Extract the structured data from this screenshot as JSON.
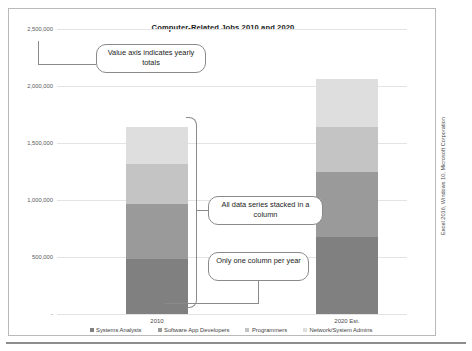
{
  "figure": {
    "credit": "Excel 2016, Windows 10, Microsoft Corporation"
  },
  "callouts": [
    {
      "id": "value-axis",
      "text": "Value axis indicates yearly totals"
    },
    {
      "id": "stacked-series",
      "text": "All data series stacked in a column"
    },
    {
      "id": "one-column",
      "text": "Only one column per year"
    }
  ],
  "chart_data": {
    "type": "bar",
    "subtype": "stacked-column",
    "title": "Computer-Related Jobs 2010 and 2020",
    "xlabel": "",
    "ylabel": "",
    "categories": [
      "2010",
      "2020 Est."
    ],
    "ylim": [
      0,
      2500000
    ],
    "yticks": [
      0,
      500000,
      1000000,
      1500000,
      2000000,
      2500000
    ],
    "ytick_labels": [
      "-",
      "500,000",
      "1,000,000",
      "1,500,000",
      "2,000,000",
      "2,500,000"
    ],
    "grid": true,
    "legend_position": "bottom",
    "series": [
      {
        "name": "Systems Analysts",
        "color": "#808080",
        "values": [
          482000,
          675000
        ]
      },
      {
        "name": "Software App Developers",
        "color": "#9a9a9a",
        "values": [
          482000,
          570000
        ]
      },
      {
        "name": "Programmers",
        "color": "#c4c4c4",
        "values": [
          350000,
          395000
        ]
      },
      {
        "name": "Network/System Admins",
        "color": "#dedede",
        "values": [
          325000,
          421000
        ]
      }
    ],
    "totals": [
      1639000,
      2061000
    ]
  }
}
